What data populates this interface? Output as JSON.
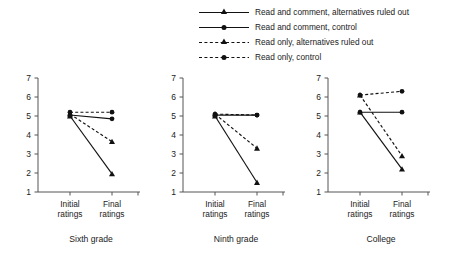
{
  "chart_data": {
    "type": "line",
    "title": "",
    "xlabel": "",
    "ylabel": "",
    "ylim": [
      1,
      7
    ],
    "yticks": [
      1,
      2,
      3,
      4,
      5,
      6,
      7
    ],
    "x": [
      "Initial ratings",
      "Final ratings"
    ],
    "grid": false,
    "legend_position": "top-center",
    "legend": [
      "Read and comment, alternatives ruled out",
      "Read and comment, control",
      "Read only, alternatives ruled out",
      "Read only, control"
    ],
    "panels": [
      {
        "title": "Sixth grade",
        "series": [
          {
            "name": "Read and comment, alternatives ruled out",
            "style": "solid",
            "marker": "triangle",
            "values": [
              5.0,
              1.95
            ]
          },
          {
            "name": "Read and comment, control",
            "style": "solid",
            "marker": "circle",
            "values": [
              5.05,
              4.85
            ]
          },
          {
            "name": "Read only, alternatives ruled out",
            "style": "dashed",
            "marker": "triangle",
            "values": [
              5.1,
              3.65
            ]
          },
          {
            "name": "Read only, control",
            "style": "dashed",
            "marker": "circle",
            "values": [
              5.2,
              5.2
            ]
          }
        ]
      },
      {
        "title": "Ninth grade",
        "series": [
          {
            "name": "Read and comment, alternatives ruled out",
            "style": "solid",
            "marker": "triangle",
            "values": [
              5.0,
              1.5
            ]
          },
          {
            "name": "Read and comment, control",
            "style": "solid",
            "marker": "circle",
            "values": [
              5.05,
              5.05
            ]
          },
          {
            "name": "Read only, alternatives ruled out",
            "style": "dashed",
            "marker": "triangle",
            "values": [
              5.1,
              3.3
            ]
          },
          {
            "name": "Read only, control",
            "style": "dashed",
            "marker": "circle",
            "values": [
              5.1,
              5.05
            ]
          }
        ]
      },
      {
        "title": "College",
        "series": [
          {
            "name": "Read and comment, alternatives ruled out",
            "style": "solid",
            "marker": "triangle",
            "values": [
              5.2,
              2.2
            ]
          },
          {
            "name": "Read and comment, control",
            "style": "solid",
            "marker": "circle",
            "values": [
              5.2,
              5.2
            ]
          },
          {
            "name": "Read only, alternatives ruled out",
            "style": "dashed",
            "marker": "triangle",
            "values": [
              6.1,
              2.9
            ]
          },
          {
            "name": "Read only, control",
            "style": "dashed",
            "marker": "circle",
            "values": [
              6.1,
              6.3
            ]
          }
        ]
      }
    ],
    "xtick_lines": [
      "Initial",
      "Final"
    ],
    "xtick_sub": "ratings",
    "colors": {
      "line": "#111111",
      "axis": "#555555",
      "text": "#222222"
    }
  }
}
